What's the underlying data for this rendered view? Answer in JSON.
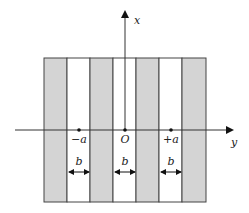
{
  "diagram": {
    "axes": {
      "vertical_label": "x",
      "horizontal_label": "y"
    },
    "points": [
      {
        "label": "−a",
        "x": 79
      },
      {
        "label": "O",
        "x": 125
      },
      {
        "label": "+a",
        "x": 171
      }
    ],
    "gaps": [
      {
        "label": "b",
        "x": 79
      },
      {
        "label": "b",
        "x": 125
      },
      {
        "label": "b",
        "x": 171
      }
    ],
    "colors": {
      "stripe": "#d4d4d4",
      "line": "#444444"
    }
  }
}
